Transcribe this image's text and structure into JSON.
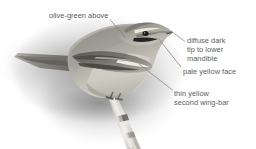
{
  "figure": {
    "background_color": "#ffffff",
    "label_color": "#5d5d5d",
    "leader_color": "#777777"
  },
  "annotations": [
    {
      "id": "olive-green-above",
      "text": "olive-green above",
      "x": 49,
      "y": 11,
      "leader": {
        "x1": 110,
        "y1": 19,
        "x2": 125,
        "y2": 37
      }
    },
    {
      "id": "diffuse-dark-tip-to-lower-mandible",
      "text": "diffuse dark\ntip to lower\nmandible",
      "x": 187,
      "y": 36,
      "leader": {
        "x1": 184,
        "y1": 41,
        "x2": 171,
        "y2": 31
      }
    },
    {
      "id": "pale-yellow-face",
      "text": "pale yellow face",
      "x": 183,
      "y": 67,
      "leader": {
        "x1": 180,
        "y1": 67,
        "x2": 158,
        "y2": 38
      }
    },
    {
      "id": "thin-yellow-second-wing-bar",
      "text": "thin yellow\nsecond wing-bar",
      "x": 174,
      "y": 89,
      "leader": {
        "x1": 172,
        "y1": 90,
        "x2": 139,
        "y2": 64
      }
    }
  ],
  "bird": {
    "plumage_upper": "olive-green above",
    "plumage_face": "pale yellow face",
    "wing_mark": "thin yellow second wing-bar",
    "bill_mark": "diffuse dark tip to lower mandible",
    "perch": "branch"
  }
}
